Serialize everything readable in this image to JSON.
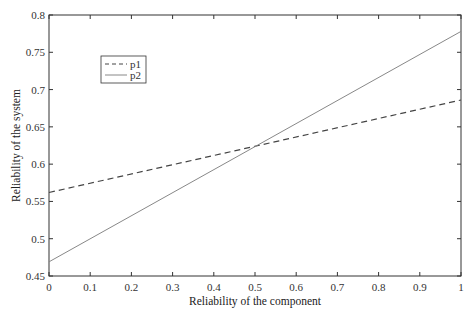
{
  "chart_data": {
    "type": "line",
    "title": "",
    "xlabel": "Reliability of the component",
    "ylabel": "Reliability of the system",
    "xlim": [
      0,
      1
    ],
    "ylim": [
      0.45,
      0.8
    ],
    "xticks": [
      "0",
      "0.1",
      "0.2",
      "0.3",
      "0.4",
      "0.5",
      "0.6",
      "0.7",
      "0.8",
      "0.9",
      "1"
    ],
    "yticks": [
      "0.45",
      "0.5",
      "0.55",
      "0.6",
      "0.65",
      "0.7",
      "0.75",
      "0.8"
    ],
    "grid": false,
    "legend_position": "upper-left",
    "x": [
      0,
      1
    ],
    "series": [
      {
        "name": "p1",
        "style": "dashed",
        "values": [
          0.562,
          0.686
        ]
      },
      {
        "name": "p2",
        "style": "solid",
        "values": [
          0.469,
          0.778
        ]
      }
    ],
    "colors": {
      "p1": "#444444",
      "p2": "#888888"
    }
  }
}
